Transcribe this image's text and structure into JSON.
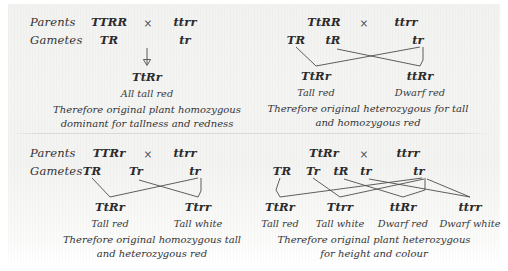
{
  "figure": {
    "title_text_present": false,
    "ink_color": "#2e2e2e",
    "line_color": "#4d4d4d",
    "paper_color": "#f3f3f2"
  },
  "row_labels": {
    "parents": "Parents",
    "gametes": "Gametes",
    "cross_symbol": "×"
  },
  "crosses": [
    {
      "id": "cross-1",
      "position": "top-left",
      "parents": [
        "TTRR",
        "ttrr"
      ],
      "gametes_left": [
        "TR"
      ],
      "gametes_right": [
        "tr"
      ],
      "offspring": [
        "TtRr"
      ],
      "phenotypes": [
        "All tall red"
      ],
      "conclusion_lines": [
        "Therefore original plant homozygous",
        "dominant for tallness and redness"
      ],
      "link_style": "single-arrow"
    },
    {
      "id": "cross-2",
      "position": "top-right",
      "parents": [
        "TtRR",
        "ttrr"
      ],
      "gametes_left": [
        "TR",
        "tR"
      ],
      "gametes_right": [
        "tr"
      ],
      "offspring": [
        "TtRr",
        "ttRr"
      ],
      "phenotypes": [
        "Tall red",
        "Dwarf red"
      ],
      "conclusion_lines": [
        "Therefore original heterozygous for tall",
        "and homozygous red"
      ],
      "link_style": "crossed"
    },
    {
      "id": "cross-3",
      "position": "bottom-left",
      "parents": [
        "TTRr",
        "ttrr"
      ],
      "gametes_left": [
        "TR",
        "Tr"
      ],
      "gametes_right": [
        "tr"
      ],
      "offspring": [
        "TtRr",
        "Ttrr"
      ],
      "phenotypes": [
        "Tall red",
        "Tall white"
      ],
      "conclusion_lines": [
        "Therefore original homozygous tall",
        "and heterozygous red"
      ],
      "link_style": "crossed"
    },
    {
      "id": "cross-4",
      "position": "bottom-right",
      "parents": [
        "TtRr",
        "ttrr"
      ],
      "gametes_left": [
        "TR",
        "Tr",
        "tR",
        "tr"
      ],
      "gametes_right": [
        "tr"
      ],
      "offspring": [
        "TtRr",
        "Ttrr",
        "ttRr",
        "ttrr"
      ],
      "phenotypes": [
        "Tall red",
        "Tall white",
        "Dwarf red",
        "Dwarf white"
      ],
      "conclusion_lines": [
        "Therefore original plant heterozygous",
        "for height and colour"
      ],
      "link_style": "crossed-multi"
    }
  ]
}
